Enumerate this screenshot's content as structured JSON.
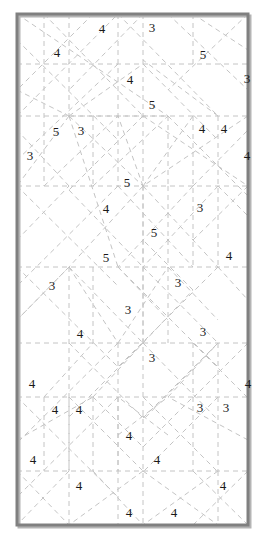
{
  "puzzle": {
    "title": "Dashed-line geometric clue grid",
    "width": 275,
    "height": 543,
    "background_color": "#ffffff",
    "frame": {
      "color": "#808080",
      "shadow_color": "#b4b4b4",
      "stroke_width": 3,
      "x": 17,
      "y": 14,
      "w": 231,
      "h": 511
    },
    "line_style": {
      "color": "#c4c4c4",
      "width": 1,
      "dash": "5,4"
    },
    "clue_color": "#1a1a1a",
    "clue_font_size": 13,
    "clues": [
      {
        "value": "4",
        "x": 102,
        "y": 28
      },
      {
        "value": "3",
        "x": 152,
        "y": 27
      },
      {
        "value": "4",
        "x": 57,
        "y": 52
      },
      {
        "value": "5",
        "x": 203,
        "y": 54
      },
      {
        "value": "4",
        "x": 130,
        "y": 79
      },
      {
        "value": "3",
        "x": 247,
        "y": 78
      },
      {
        "value": "5",
        "x": 152,
        "y": 104
      },
      {
        "value": "5",
        "x": 56,
        "y": 131
      },
      {
        "value": "3",
        "x": 81,
        "y": 130
      },
      {
        "value": "4",
        "x": 202,
        "y": 128
      },
      {
        "value": "4",
        "x": 224,
        "y": 128
      },
      {
        "value": "3",
        "x": 30,
        "y": 155
      },
      {
        "value": "4",
        "x": 247,
        "y": 155
      },
      {
        "value": "5",
        "x": 127,
        "y": 182
      },
      {
        "value": "4",
        "x": 106,
        "y": 208
      },
      {
        "value": "3",
        "x": 200,
        "y": 207
      },
      {
        "value": "5",
        "x": 154,
        "y": 232
      },
      {
        "value": "5",
        "x": 106,
        "y": 257
      },
      {
        "value": "4",
        "x": 229,
        "y": 255
      },
      {
        "value": "3",
        "x": 52,
        "y": 285
      },
      {
        "value": "3",
        "x": 178,
        "y": 282
      },
      {
        "value": "3",
        "x": 128,
        "y": 309
      },
      {
        "value": "4",
        "x": 80,
        "y": 333
      },
      {
        "value": "3",
        "x": 203,
        "y": 331
      },
      {
        "value": "3",
        "x": 152,
        "y": 357
      },
      {
        "value": "4",
        "x": 32,
        "y": 383
      },
      {
        "value": "4",
        "x": 248,
        "y": 383
      },
      {
        "value": "4",
        "x": 55,
        "y": 409
      },
      {
        "value": "4",
        "x": 79,
        "y": 409
      },
      {
        "value": "3",
        "x": 200,
        "y": 407
      },
      {
        "value": "3",
        "x": 226,
        "y": 407
      },
      {
        "value": "4",
        "x": 129,
        "y": 435
      },
      {
        "value": "4",
        "x": 33,
        "y": 459
      },
      {
        "value": "4",
        "x": 157,
        "y": 459
      },
      {
        "value": "4",
        "x": 79,
        "y": 485
      },
      {
        "value": "4",
        "x": 223,
        "y": 485
      },
      {
        "value": "4",
        "x": 129,
        "y": 512
      },
      {
        "value": "4",
        "x": 174,
        "y": 512
      }
    ],
    "segments": [
      [
        17,
        64,
        248,
        64
      ],
      [
        17,
        186,
        248,
        186
      ],
      [
        17,
        267,
        248,
        267
      ],
      [
        17,
        397,
        248,
        397
      ],
      [
        17,
        471,
        248,
        471
      ],
      [
        17,
        116,
        248,
        116
      ],
      [
        17,
        343,
        248,
        343
      ],
      [
        44,
        14,
        44,
        186
      ],
      [
        69,
        14,
        69,
        116
      ],
      [
        93,
        116,
        93,
        186
      ],
      [
        69,
        267,
        69,
        525
      ],
      [
        93,
        267,
        93,
        343
      ],
      [
        44,
        397,
        44,
        471
      ],
      [
        69,
        397,
        69,
        471
      ],
      [
        118,
        14,
        118,
        186
      ],
      [
        143,
        14,
        143,
        525
      ],
      [
        168,
        116,
        168,
        186
      ],
      [
        143,
        186,
        143,
        343
      ],
      [
        168,
        186,
        168,
        343
      ],
      [
        193,
        116,
        193,
        267
      ],
      [
        218,
        116,
        218,
        267
      ],
      [
        193,
        343,
        193,
        471
      ],
      [
        218,
        343,
        218,
        471
      ],
      [
        218,
        471,
        218,
        525
      ],
      [
        118,
        343,
        118,
        471
      ],
      [
        93,
        397,
        93,
        471
      ],
      [
        118,
        397,
        118,
        525
      ],
      [
        193,
        14,
        193,
        64
      ],
      [
        17,
        14,
        168,
        116
      ],
      [
        17,
        116,
        118,
        14
      ],
      [
        44,
        14,
        143,
        116
      ],
      [
        93,
        14,
        17,
        90
      ],
      [
        118,
        14,
        218,
        116
      ],
      [
        168,
        14,
        248,
        90
      ],
      [
        193,
        14,
        248,
        50
      ],
      [
        248,
        14,
        168,
        90
      ],
      [
        143,
        14,
        69,
        90
      ],
      [
        17,
        40,
        118,
        140
      ],
      [
        118,
        64,
        17,
        160
      ],
      [
        69,
        116,
        143,
        64
      ],
      [
        69,
        116,
        143,
        186
      ],
      [
        69,
        116,
        168,
        116
      ],
      [
        69,
        116,
        118,
        267
      ],
      [
        69,
        116,
        17,
        186
      ],
      [
        143,
        64,
        218,
        140
      ],
      [
        168,
        116,
        248,
        196
      ],
      [
        143,
        186,
        69,
        267
      ],
      [
        143,
        186,
        218,
        267
      ],
      [
        143,
        186,
        118,
        116
      ],
      [
        143,
        186,
        193,
        116
      ],
      [
        17,
        186,
        118,
        286
      ],
      [
        118,
        186,
        17,
        286
      ],
      [
        143,
        116,
        69,
        190
      ],
      [
        69,
        190,
        143,
        267
      ],
      [
        143,
        267,
        218,
        343
      ],
      [
        218,
        186,
        143,
        267
      ],
      [
        118,
        267,
        218,
        367
      ],
      [
        218,
        267,
        118,
        367
      ],
      [
        69,
        267,
        143,
        343
      ],
      [
        143,
        343,
        69,
        417
      ],
      [
        69,
        267,
        17,
        320
      ],
      [
        248,
        186,
        193,
        240
      ],
      [
        17,
        267,
        118,
        367
      ],
      [
        118,
        343,
        17,
        443
      ],
      [
        143,
        343,
        218,
        420
      ],
      [
        218,
        343,
        143,
        420
      ],
      [
        69,
        343,
        143,
        418
      ],
      [
        143,
        418,
        218,
        343
      ],
      [
        93,
        397,
        143,
        343
      ],
      [
        168,
        397,
        218,
        343
      ],
      [
        193,
        343,
        248,
        398
      ],
      [
        248,
        343,
        193,
        398
      ],
      [
        17,
        397,
        118,
        497
      ],
      [
        118,
        397,
        17,
        497
      ],
      [
        143,
        397,
        218,
        472
      ],
      [
        218,
        397,
        143,
        472
      ],
      [
        69,
        397,
        143,
        471
      ],
      [
        143,
        471,
        69,
        525
      ],
      [
        143,
        471,
        218,
        525
      ],
      [
        218,
        471,
        143,
        525
      ],
      [
        93,
        471,
        143,
        525
      ],
      [
        193,
        471,
        248,
        525
      ],
      [
        248,
        471,
        193,
        525
      ],
      [
        17,
        471,
        69,
        525
      ],
      [
        69,
        471,
        17,
        525
      ],
      [
        93,
        397,
        143,
        447
      ],
      [
        143,
        447,
        193,
        397
      ],
      [
        118,
        435,
        168,
        397
      ],
      [
        168,
        435,
        118,
        397
      ],
      [
        17,
        440,
        93,
        397
      ],
      [
        248,
        440,
        168,
        397
      ],
      [
        44,
        186,
        118,
        116
      ],
      [
        93,
        186,
        168,
        116
      ],
      [
        193,
        186,
        248,
        130
      ],
      [
        218,
        116,
        143,
        60
      ],
      [
        17,
        90,
        69,
        116
      ],
      [
        143,
        116,
        248,
        186
      ],
      [
        248,
        116,
        143,
        186
      ],
      [
        17,
        320,
        69,
        267
      ],
      [
        118,
        186,
        193,
        267
      ],
      [
        193,
        186,
        118,
        267
      ],
      [
        218,
        186,
        248,
        216
      ],
      [
        69,
        267,
        118,
        343
      ],
      [
        118,
        343,
        168,
        267
      ],
      [
        168,
        267,
        218,
        320
      ],
      [
        218,
        267,
        248,
        300
      ],
      [
        44,
        397,
        93,
        343
      ],
      [
        143,
        343,
        193,
        290
      ],
      [
        193,
        290,
        143,
        240
      ],
      [
        118,
        267,
        168,
        320
      ],
      [
        17,
        14,
        44,
        14
      ],
      [
        17,
        240,
        69,
        186
      ],
      [
        69,
        186,
        17,
        130
      ]
    ]
  }
}
